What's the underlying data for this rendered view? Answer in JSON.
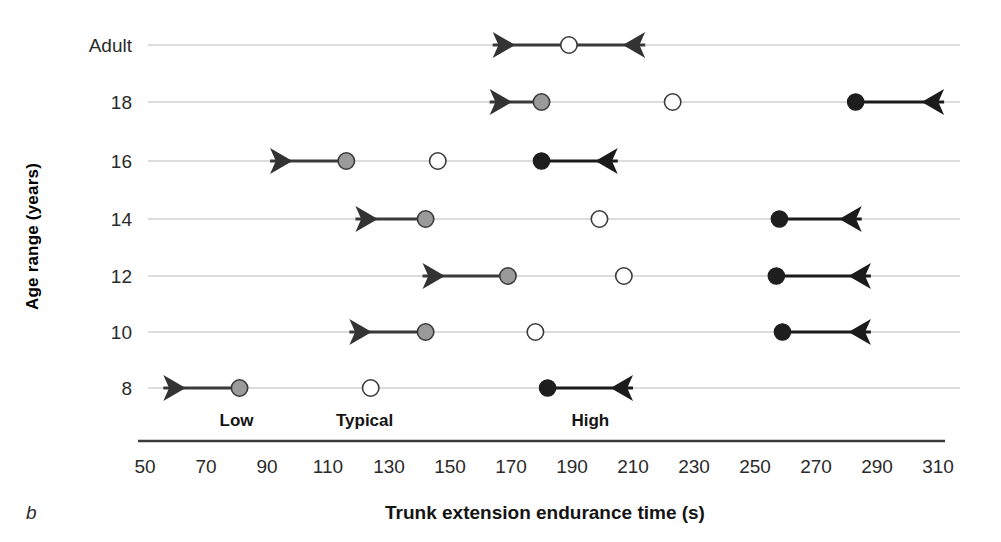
{
  "figure": {
    "panel_letter": "b",
    "xlabel": "Trunk extension endurance time (s)",
    "ylabel": "Age range (years)"
  },
  "zones": [
    {
      "name": "low",
      "label": "Low",
      "x": 80
    },
    {
      "name": "typical",
      "label": "Typical",
      "x": 122
    },
    {
      "name": "high",
      "label": "High",
      "x": 196
    }
  ],
  "chart_data": {
    "type": "scatter",
    "title": "",
    "xlabel": "Trunk extension endurance time (s)",
    "ylabel": "Age range (years)",
    "xlim": [
      50,
      310
    ],
    "xticks": [
      50,
      70,
      90,
      110,
      130,
      150,
      170,
      190,
      210,
      230,
      250,
      270,
      290,
      310
    ],
    "categories": [
      "Adult",
      "18",
      "16",
      "14",
      "12",
      "10",
      "8"
    ],
    "grid": true,
    "legend": false,
    "marker_kinds": [
      {
        "name": "low",
        "fill": "#9a9a9a",
        "edge": "#3a3a3a",
        "meaning": "Low cut-off",
        "arrow": "left"
      },
      {
        "name": "typical",
        "fill": "#ffffff",
        "edge": "#3a3a3a",
        "meaning": "Typical value",
        "arrow": "none"
      },
      {
        "name": "high",
        "fill": "#1e1e1e",
        "edge": "#1e1e1e",
        "meaning": "High cut-off",
        "arrow": "right"
      }
    ],
    "series": [
      {
        "name": "Adult",
        "points": [
          {
            "kind": "typical",
            "value": 189,
            "arrow": "both",
            "arrow_from": 164,
            "arrow_to": 214
          }
        ]
      },
      {
        "name": "18",
        "points": [
          {
            "kind": "low",
            "value": 180,
            "arrow": "left",
            "arrow_to": 163
          },
          {
            "kind": "typical",
            "value": 223,
            "arrow": "none"
          },
          {
            "kind": "high",
            "value": 283,
            "arrow": "right",
            "arrow_to": 312
          }
        ]
      },
      {
        "name": "16",
        "points": [
          {
            "kind": "low",
            "value": 116,
            "arrow": "left",
            "arrow_to": 91
          },
          {
            "kind": "typical",
            "value": 146,
            "arrow": "none"
          },
          {
            "kind": "high",
            "value": 180,
            "arrow": "right",
            "arrow_to": 205
          }
        ]
      },
      {
        "name": "14",
        "points": [
          {
            "kind": "low",
            "value": 142,
            "arrow": "left",
            "arrow_to": 119
          },
          {
            "kind": "typical",
            "value": 199,
            "arrow": "none"
          },
          {
            "kind": "high",
            "value": 258,
            "arrow": "right",
            "arrow_to": 285
          }
        ]
      },
      {
        "name": "12",
        "points": [
          {
            "kind": "low",
            "value": 169,
            "arrow": "left",
            "arrow_to": 141
          },
          {
            "kind": "typical",
            "value": 207,
            "arrow": "none"
          },
          {
            "kind": "high",
            "value": 257,
            "arrow": "right",
            "arrow_to": 288
          }
        ]
      },
      {
        "name": "10",
        "points": [
          {
            "kind": "low",
            "value": 142,
            "arrow": "left",
            "arrow_to": 117
          },
          {
            "kind": "typical",
            "value": 178,
            "arrow": "none"
          },
          {
            "kind": "high",
            "value": 259,
            "arrow": "right",
            "arrow_to": 288
          }
        ]
      },
      {
        "name": "8",
        "points": [
          {
            "kind": "low",
            "value": 81,
            "arrow": "left",
            "arrow_to": 56
          },
          {
            "kind": "typical",
            "value": 124,
            "arrow": "none"
          },
          {
            "kind": "high",
            "value": 182,
            "arrow": "right",
            "arrow_to": 210
          }
        ]
      }
    ]
  }
}
